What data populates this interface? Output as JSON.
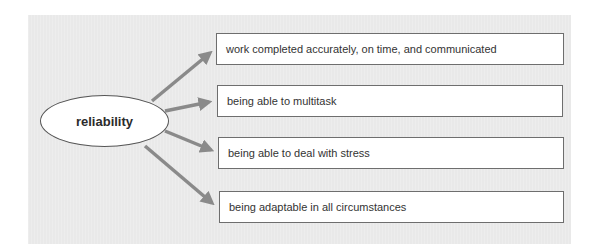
{
  "diagram": {
    "center_node": {
      "label": "reliability"
    },
    "branches": [
      {
        "label": "work completed accurately, on time, and communicated"
      },
      {
        "label": "being able to multitask"
      },
      {
        "label": "being able to deal with stress"
      },
      {
        "label": "being adaptable in all circumstances"
      }
    ],
    "colors": {
      "panel_background": "#e9e9e9",
      "arrow": "#8a8a8a",
      "node_fill": "#ffffff",
      "node_border": "#555555",
      "text": "#333333"
    }
  }
}
